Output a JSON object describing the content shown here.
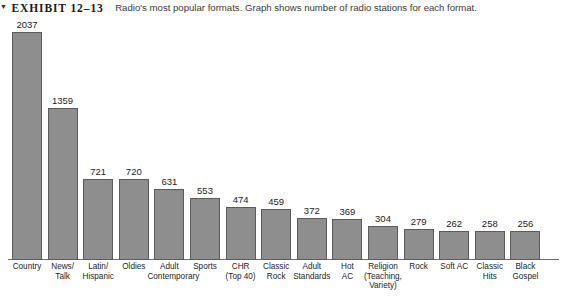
{
  "caption": {
    "marker_icon": "triangle-marker-icon",
    "exhibit_label": "EXHIBIT 12–13",
    "text": "Radio's most popular formats. Graph shows number of radio stations for each format."
  },
  "colors": {
    "bar_fill": "#8e8e8e",
    "bar_stroke": "#5c5c5c",
    "baseline": "#6d6d6d",
    "text": "#1c1c1c",
    "background": "#ffffff"
  },
  "chart_data": {
    "type": "bar",
    "title": "Radio's most popular formats. Graph shows number of radio stations for each format.",
    "xlabel": "",
    "ylabel": "",
    "ylim": [
      0,
      2037
    ],
    "grid": false,
    "legend": false,
    "categories": [
      "Country",
      "News/\nTalk",
      "Latin/\nHispanic",
      "Oldies",
      "Adult\nContemporary",
      "Sports",
      "CHR\n(Top 40)",
      "Classic\nRock",
      "Adult\nStandards",
      "Hot\nAC",
      "Religion\n(Teaching,\nVariety)",
      "Rock",
      "Soft AC",
      "Classic\nHits",
      "Black\nGospel"
    ],
    "values": [
      2037,
      1359,
      721,
      720,
      631,
      553,
      474,
      459,
      372,
      369,
      304,
      279,
      262,
      258,
      256
    ]
  }
}
